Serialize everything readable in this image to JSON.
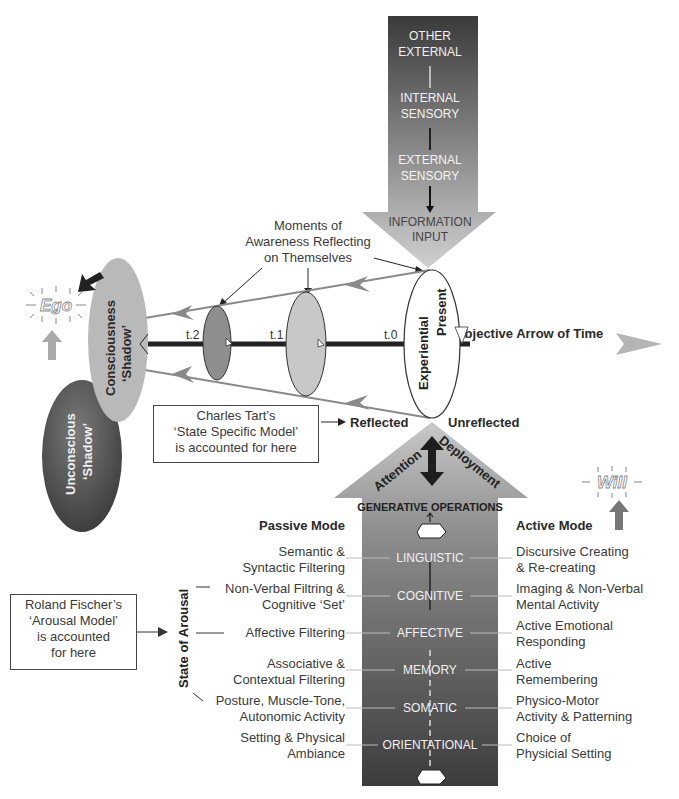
{
  "diagram": {
    "input_arrow": {
      "stages": [
        "OTHER",
        "EXTERNAL",
        "INTERNAL",
        "SENSORY",
        "EXTERNAL",
        "SENSORY"
      ],
      "tip": [
        "INFORMATION",
        "INPUT"
      ]
    },
    "moments_label": [
      "Moments of",
      "Awareness Reflecting",
      "on Themselves"
    ],
    "ego_label": "Ego",
    "will_label": "Will",
    "consciousness_shadow": [
      "Consciousness",
      "‘Shadow’"
    ],
    "unconscious_shadow": [
      "Unconscious",
      "‘Shadow’"
    ],
    "time_markers": {
      "t2": "t.2",
      "t1": "t.1",
      "t0": "t.0"
    },
    "experiential_present": [
      "Experiential",
      "Present"
    ],
    "time_arrow_label": "Subjective Arrow of Time",
    "reflected_label": "Reflected",
    "unreflected_label": "Unreflected",
    "tart_box": [
      "Charles Tart’s",
      "‘State Specific Model’",
      "is accounted for here"
    ],
    "fischer_box": [
      "Roland Fischer’s",
      "‘Arousal Model’",
      "is accounted",
      "for here"
    ],
    "attention_label": "Attention",
    "deployment_label": "Deployment",
    "generative_label": "GENERATIVE OPERATIONS",
    "state_of_arousal": "State of Arousal",
    "passive_mode": "Passive Mode",
    "active_mode": "Active Mode",
    "levels": [
      {
        "name": "LINGUISTIC",
        "passive": [
          "Semantic &",
          "Syntactic Filtering"
        ],
        "active": [
          "Discursive Creating",
          "& Re-creating"
        ]
      },
      {
        "name": "COGNITIVE",
        "passive": [
          "Non-Verbal Filtring &",
          "Cognitive ‘Set’"
        ],
        "active": [
          "Imaging & Non-Verbal",
          "Mental Activity"
        ]
      },
      {
        "name": "AFFECTIVE",
        "passive": [
          "Affective Filtering"
        ],
        "active": [
          "Active Emotional",
          "Responding"
        ]
      },
      {
        "name": "MEMORY",
        "passive": [
          "Associative &",
          "Contextual Filtering"
        ],
        "active": [
          "Active",
          "Remembering"
        ]
      },
      {
        "name": "SOMATIC",
        "passive": [
          "Posture, Muscle-Tone,",
          "Autonomic Activity"
        ],
        "active": [
          "Physico-Motor",
          "Activity & Patterning"
        ]
      },
      {
        "name": "ORIENTATIONAL",
        "passive": [
          "Setting & Physical",
          "Ambiance"
        ],
        "active": [
          "Choice of",
          "Physicial Setting"
        ]
      }
    ],
    "colors": {
      "dark": "#3c3c3c",
      "mid": "#8a8a8a",
      "light": "#c8c8c8",
      "line": "#2a2a2a"
    }
  }
}
